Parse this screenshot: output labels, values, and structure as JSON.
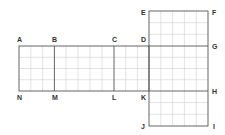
{
  "diagram": {
    "type": "net-of-cuboid-on-grid",
    "colors": {
      "grid": "#cfcfcf",
      "outline": "#555555",
      "label": "#333333",
      "background": "#ffffff"
    },
    "cell_size": 11.8,
    "labels": {
      "A": "A",
      "B": "B",
      "C": "C",
      "D": "D",
      "E": "E",
      "F": "F",
      "G": "G",
      "H": "H",
      "I": "I",
      "J": "J",
      "K": "K",
      "L": "L",
      "M": "M",
      "N": "N"
    },
    "faces": [
      {
        "name": "ABMN",
        "cols": 3,
        "rows": 4
      },
      {
        "name": "BCLM",
        "cols": 5,
        "rows": 4
      },
      {
        "name": "CDKL",
        "cols": 3,
        "rows": 4
      },
      {
        "name": "EFGD",
        "cols": 5,
        "rows": 3
      },
      {
        "name": "DGHK",
        "cols": 5,
        "rows": 4
      },
      {
        "name": "KHIJ",
        "cols": 5,
        "rows": 3
      }
    ]
  }
}
